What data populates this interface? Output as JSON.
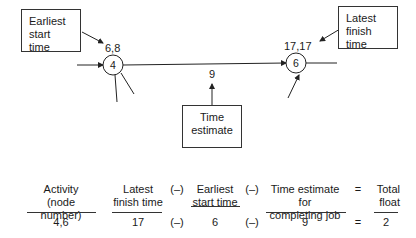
{
  "diagram": {
    "callouts": {
      "earliest_start": [
        "Earliest",
        "start time"
      ],
      "latest_finish": [
        "Latest",
        "finish time"
      ],
      "time_estimate": [
        "Time",
        "estimate"
      ]
    },
    "nodes": [
      {
        "id": "4",
        "times": "6,8"
      },
      {
        "id": "6",
        "times": "17,17"
      }
    ],
    "activity_duration": "9"
  },
  "formula": {
    "headers": {
      "activity": [
        "Activity",
        "(node number)"
      ],
      "latest_finish": [
        "Latest",
        "finish time"
      ],
      "earliest_start": [
        "Earliest",
        "start time"
      ],
      "time_estimate": [
        "Time estimate for",
        "completing job"
      ],
      "total_float": [
        "Total",
        "float"
      ]
    },
    "operators": {
      "minus": "(–)",
      "equals": "="
    },
    "values": {
      "activity": "4,6",
      "latest_finish": "17",
      "earliest_start": "6",
      "time_estimate": "9",
      "total_float": "2"
    }
  }
}
